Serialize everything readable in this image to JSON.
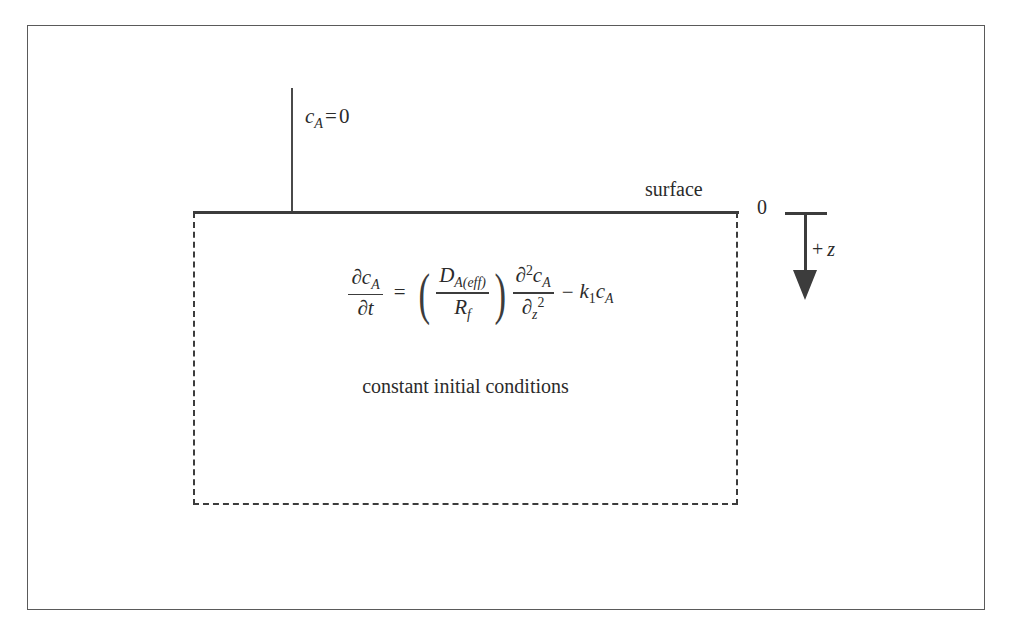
{
  "figure": {
    "boundary_condition": {
      "variable": "c",
      "subscript": "A",
      "operator": "=",
      "value": "0"
    },
    "surface_label": "surface",
    "depth_axis": {
      "origin_label": "0",
      "plus_sign": "+",
      "direction_variable": "z"
    },
    "equation": {
      "lhs_numerator_partial": "∂",
      "lhs_numerator_var": "c",
      "lhs_numerator_sub": "A",
      "lhs_denominator_partial": "∂",
      "lhs_denominator_var": "t",
      "equals": "=",
      "paren_open": "(",
      "paren_close": ")",
      "coeff_numerator_var": "D",
      "coeff_numerator_sub": "A(eff)",
      "coeff_denominator_var": "R",
      "coeff_denominator_sub": "f",
      "diff_numerator_partial": "∂",
      "diff_numerator_order": "2",
      "diff_numerator_var": "c",
      "diff_numerator_sub": "A",
      "diff_denominator_partial": "∂",
      "diff_denominator_var": "z",
      "diff_denominator_order": "2",
      "minus": "−",
      "rate_var": "k",
      "rate_sub": "1",
      "conc_var": "c",
      "conc_sub": "A"
    },
    "initial_conditions_caption": "constant initial conditions",
    "colors": {
      "ink": "#2b2b2b",
      "line": "#3c3c3c",
      "frame": "#5a5a5a",
      "background": "#ffffff"
    }
  }
}
